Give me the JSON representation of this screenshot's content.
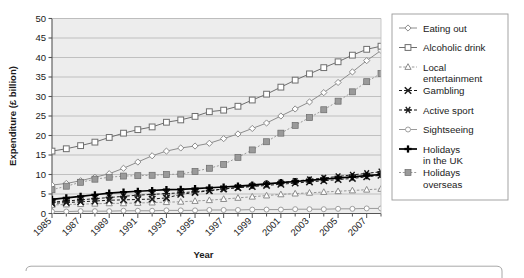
{
  "chart_data": {
    "type": "line",
    "title": "",
    "xlabel": "Year",
    "ylabel": "Expenditure (£ billion)",
    "xlim": [
      1985,
      2008
    ],
    "ylim": [
      0,
      50
    ],
    "ytick_step": 5,
    "grid": "horizontal",
    "legend_position": "right",
    "yticks": [
      "0",
      "5",
      "10",
      "15",
      "20",
      "25",
      "30",
      "35",
      "40",
      "45",
      "50"
    ],
    "x": [
      1985,
      1986,
      1987,
      1988,
      1989,
      1990,
      1991,
      1992,
      1993,
      1994,
      1995,
      1996,
      1997,
      1998,
      1999,
      2000,
      2001,
      2002,
      2003,
      2004,
      2005,
      2006,
      2007,
      2008
    ],
    "xticklabels": [
      "1985",
      "1987",
      "1989",
      "1991",
      "1993",
      "1995",
      "1997",
      "1999",
      "2001",
      "2003",
      "2005",
      "2007"
    ],
    "xticklabel_years": [
      1985,
      1987,
      1989,
      1991,
      1993,
      1995,
      1997,
      1999,
      2001,
      2003,
      2005,
      2007
    ],
    "series": [
      {
        "name": "Eating out",
        "marker": "open-diamond",
        "color": "#8c8c8c",
        "values": [
          7.3,
          7.7,
          8.4,
          9.3,
          10.2,
          11.6,
          13.2,
          14.8,
          16.0,
          16.8,
          17.3,
          18.0,
          19.2,
          20.4,
          21.8,
          23.2,
          25.0,
          26.8,
          28.6,
          31.0,
          33.6,
          36.3,
          39.2,
          41.8
        ]
      },
      {
        "name": "Alcoholic drink",
        "marker": "open-square",
        "color": "#6e6e6e",
        "values": [
          16.0,
          16.6,
          17.4,
          18.3,
          19.5,
          20.6,
          21.5,
          22.2,
          23.4,
          24.0,
          24.9,
          26.1,
          26.5,
          27.5,
          29.1,
          30.6,
          32.4,
          34.2,
          35.8,
          37.4,
          38.9,
          40.6,
          42.1,
          42.9
        ]
      },
      {
        "name": "Local entertainment",
        "marker": "open-triangle",
        "color": "#8c8c8c",
        "values": [
          2.2,
          2.3,
          2.4,
          2.5,
          2.6,
          2.6,
          2.7,
          2.8,
          2.9,
          3.0,
          3.2,
          3.4,
          3.7,
          4.0,
          4.3,
          4.6,
          4.9,
          5.1,
          5.3,
          5.5,
          5.7,
          5.9,
          6.1,
          6.3
        ]
      },
      {
        "name": "Gambling",
        "marker": "cross-x",
        "color": "#1a1a1a",
        "values": [
          2.6,
          2.8,
          3.0,
          3.2,
          3.4,
          3.5,
          3.6,
          3.7,
          4.0,
          4.9,
          5.4,
          5.8,
          6.3,
          6.6,
          6.9,
          7.2,
          7.5,
          7.8,
          8.1,
          8.4,
          8.7,
          9.0,
          9.4,
          9.8
        ]
      },
      {
        "name": "Active sport",
        "marker": "asterisk",
        "color": "#1a1a1a",
        "values": [
          2.9,
          3.2,
          3.5,
          3.8,
          4.1,
          4.4,
          4.7,
          4.9,
          5.1,
          5.3,
          5.6,
          5.9,
          6.3,
          6.7,
          7.1,
          7.5,
          7.9,
          8.3,
          8.7,
          9.1,
          9.5,
          9.9,
          10.3,
          10.7
        ]
      },
      {
        "name": "Sightseeing",
        "marker": "open-circle-small",
        "color": "#9a9a9a",
        "values": [
          0.5,
          0.5,
          0.6,
          0.6,
          0.6,
          0.7,
          0.7,
          0.7,
          0.8,
          0.8,
          0.8,
          0.9,
          0.9,
          0.9,
          1.0,
          1.0,
          1.0,
          1.1,
          1.1,
          1.1,
          1.2,
          1.2,
          1.3,
          1.3
        ]
      },
      {
        "name": "Holidays in the UK",
        "marker": "plus-bold",
        "color": "#000000",
        "values": [
          3.6,
          4.0,
          4.4,
          4.8,
          5.2,
          5.5,
          5.7,
          5.9,
          6.1,
          6.2,
          6.4,
          6.6,
          6.8,
          7.0,
          7.3,
          7.6,
          7.9,
          8.2,
          8.5,
          8.8,
          9.1,
          9.4,
          9.7,
          10.0
        ]
      },
      {
        "name": "Holidays overseas",
        "marker": "filled-square",
        "color": "#9a9a9a",
        "values": [
          6.1,
          7.0,
          8.0,
          8.8,
          9.3,
          9.6,
          9.7,
          9.8,
          10.0,
          10.1,
          10.8,
          11.6,
          12.6,
          14.4,
          16.3,
          18.4,
          20.6,
          22.6,
          24.6,
          26.6,
          28.8,
          31.2,
          33.8,
          35.9
        ]
      }
    ]
  },
  "legend": {
    "entries": [
      {
        "label": "Eating out",
        "label2": ""
      },
      {
        "label": "Alcoholic drink",
        "label2": ""
      },
      {
        "label": "Local",
        "label2": "entertainment"
      },
      {
        "label": "Gambling",
        "label2": ""
      },
      {
        "label": "Active sport",
        "label2": ""
      },
      {
        "label": "Sightseeing",
        "label2": ""
      },
      {
        "label": "Holidays",
        "label2": "in the UK"
      },
      {
        "label": "Holidays",
        "label2": "overseas"
      }
    ]
  },
  "colors": {
    "plot_background": "#ededed",
    "gridline": "#b4b4b4",
    "axis": "#555555",
    "page_background": "#ffffff",
    "legend_border": "#9a9a9a",
    "caption_border": "#a8a8a8"
  }
}
